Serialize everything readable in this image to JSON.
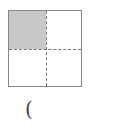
{
  "figure": {
    "quadrants": 4,
    "shaded_quadrants": [
      "top-left"
    ],
    "shade_color": "#c8c8c8",
    "border_color": "#888888"
  },
  "answer": {
    "text": "("
  }
}
